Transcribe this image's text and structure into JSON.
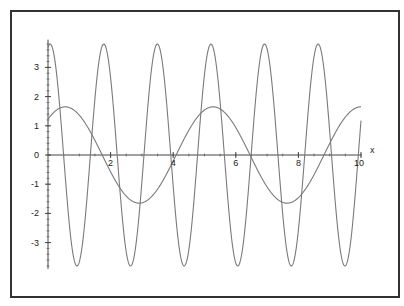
{
  "chart_data": {
    "type": "line",
    "title": "",
    "xlabel": "x",
    "ylabel": "",
    "xlim": [
      0,
      10
    ],
    "ylim": [
      -3.9,
      3.95
    ],
    "grid": false,
    "legend": null,
    "x_ticks": [
      2,
      4,
      6,
      8,
      10
    ],
    "x_tick_labels": [
      "2",
      "4",
      "6",
      "8",
      "10"
    ],
    "y_ticks": [
      -3,
      -2,
      -1,
      0,
      1,
      2,
      3
    ],
    "y_tick_labels": [
      "-3",
      "-2",
      "-1",
      "0",
      "1",
      "2",
      "3"
    ],
    "x": [
      0,
      0.5,
      1,
      1.5,
      2,
      2.5,
      3,
      3.5,
      4,
      4.5,
      5,
      5.5,
      6,
      6.5,
      7,
      7.5,
      8,
      8.5,
      9,
      9.5,
      10
    ],
    "series": [
      {
        "name": "fast oscillation",
        "model": {
          "amplitude": 3.8,
          "omega": 3.67,
          "phase_shift": 0.07
        },
        "values": [
          3.67,
          -0.03,
          -3.67,
          1.93,
          2.64,
          -3.31,
          -0.92,
          3.8,
          -1.0,
          -3.27,
          2.71,
          1.86,
          -3.68,
          0.09,
          3.64,
          -2.09,
          -2.48,
          3.37,
          0.82,
          -3.8,
          1.15
        ]
      },
      {
        "name": "slow oscillation",
        "model": {
          "amplitude": 1.65,
          "omega": 1.33,
          "phase_shift": 0.55
        },
        "values": [
          1.23,
          1.65,
          1.36,
          0.5,
          -0.58,
          -1.41,
          -1.64,
          -1.16,
          -0.2,
          0.85,
          1.54,
          1.57,
          0.94,
          -0.1,
          -1.08,
          -1.62,
          -1.46,
          -0.67,
          0.38,
          1.28,
          1.65
        ]
      }
    ],
    "colors": {
      "curves": "#7a7a7a",
      "axes": "#444444",
      "frame": "#333333",
      "text": "#222222"
    }
  }
}
